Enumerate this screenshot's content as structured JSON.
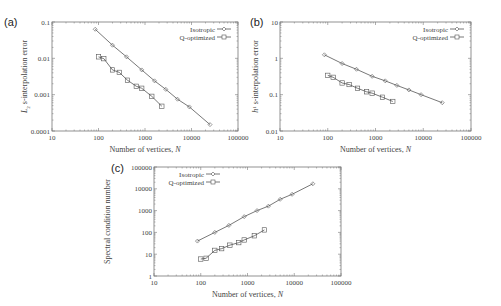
{
  "chart_data": [
    {
      "panel": "(a)",
      "type": "line",
      "xscale": "log",
      "yscale": "log",
      "title": "",
      "xlabel": "Number of vertices, N",
      "ylabel": "L2 s-interpolation error",
      "xlim": [
        10,
        100000
      ],
      "ylim": [
        0.0001,
        0.1
      ],
      "xticks": [
        "10",
        "100",
        "1000",
        "10000",
        "100000"
      ],
      "yticks": [
        "0.0001",
        "0.001",
        "0.01",
        "0.1"
      ],
      "legend_position": "top-right",
      "series": [
        {
          "name": "Isotropic",
          "marker": "diamond",
          "x": [
            85,
            200,
            400,
            850,
            1600,
            2800,
            5000,
            9000,
            25000
          ],
          "y": [
            0.063,
            0.023,
            0.011,
            0.0048,
            0.0024,
            0.0014,
            0.00075,
            0.00046,
            0.00015
          ]
        },
        {
          "name": "Q-optimized",
          "marker": "square",
          "x": [
            100,
            130,
            200,
            280,
            420,
            650,
            850,
            1400,
            2300
          ],
          "y": [
            0.011,
            0.0098,
            0.0048,
            0.0041,
            0.0025,
            0.0017,
            0.0015,
            0.0009,
            0.00048
          ]
        }
      ]
    },
    {
      "panel": "(b)",
      "type": "line",
      "xscale": "log",
      "yscale": "log",
      "title": "",
      "xlabel": "Number of vertices, N",
      "ylabel": "h^1 s-interpolation error",
      "xlim": [
        10,
        100000
      ],
      "ylim": [
        0.01,
        10
      ],
      "xticks": [
        "10",
        "100",
        "1000",
        "10000",
        "100000"
      ],
      "yticks": [
        "0.01",
        "0.1",
        "1",
        "10"
      ],
      "legend_position": "top-right",
      "series": [
        {
          "name": "Isotropic",
          "marker": "diamond",
          "x": [
            85,
            200,
            400,
            850,
            1600,
            2800,
            5000,
            9000,
            25000
          ],
          "y": [
            1.25,
            0.72,
            0.5,
            0.32,
            0.24,
            0.18,
            0.135,
            0.1,
            0.06
          ]
        },
        {
          "name": "Q-optimized",
          "marker": "square",
          "x": [
            100,
            130,
            200,
            280,
            420,
            650,
            850,
            1400,
            2300
          ],
          "y": [
            0.34,
            0.3,
            0.21,
            0.19,
            0.15,
            0.12,
            0.11,
            0.085,
            0.065
          ]
        }
      ]
    },
    {
      "panel": "(c)",
      "type": "line",
      "xscale": "log",
      "yscale": "log",
      "title": "",
      "xlabel": "Number of vertices, N",
      "ylabel": "Spectral condition number",
      "xlim": [
        10,
        100000
      ],
      "ylim": [
        1,
        100000
      ],
      "xticks": [
        "10",
        "100",
        "1000",
        "10000",
        "100000"
      ],
      "yticks": [
        "1",
        "10",
        "100",
        "1000",
        "10000",
        "100000"
      ],
      "legend_position": "top-left",
      "series": [
        {
          "name": "Isotropic",
          "marker": "diamond",
          "x": [
            85,
            200,
            400,
            850,
            1600,
            2800,
            5000,
            9000,
            25000
          ],
          "y": [
            40,
            100,
            210,
            530,
            1000,
            1600,
            3300,
            5600,
            17000
          ]
        },
        {
          "name": "Q-optimized",
          "marker": "square",
          "x": [
            100,
            130,
            200,
            280,
            420,
            650,
            850,
            1400,
            2300
          ],
          "y": [
            6,
            6.5,
            15,
            18,
            26,
            34,
            45,
            70,
            130
          ]
        }
      ]
    }
  ],
  "panels": [
    {
      "letter": "(a)",
      "ylabel": "L",
      "ylabel_sub": "2",
      "ylabel_rest": " s-interpolation error"
    },
    {
      "letter": "(b)",
      "ylabel": "h",
      "ylabel_sup": "1",
      "ylabel_rest": " s-interpolation error"
    },
    {
      "letter": "(c)",
      "ylabel": "Spectral condition number"
    }
  ],
  "common": {
    "xlabel": "Number of vertices, N",
    "legend": [
      "Isotropic",
      "Q-optimized"
    ],
    "line_color": "#555555",
    "frame_color": "#777777"
  }
}
